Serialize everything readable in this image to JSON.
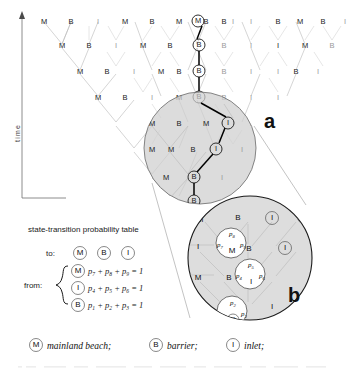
{
  "figure": {
    "axis": {
      "label": "time",
      "direction": "upward-arrow"
    },
    "panels": [
      {
        "id": "a",
        "label": "a"
      },
      {
        "id": "b",
        "label": "b"
      }
    ],
    "states": [
      {
        "code": "M",
        "name": "mainland beach"
      },
      {
        "code": "B",
        "name": "barrier"
      },
      {
        "code": "I",
        "name": "inlet"
      }
    ],
    "lattice": {
      "rows": [
        {
          "level": 0,
          "labels": [
            "M",
            "B",
            "I",
            "M",
            "B",
            "M",
            "B",
            "I",
            "M",
            "B",
            "I",
            "B",
            "M",
            "B",
            "I"
          ]
        },
        {
          "level": 1,
          "labels": [
            "M",
            "B",
            "I",
            "M",
            "B",
            "I",
            "B",
            "M",
            "B",
            "I",
            "I",
            "M",
            "B",
            "I"
          ]
        },
        {
          "level": 2,
          "labels": [
            "M",
            "B",
            "I",
            "M",
            "B",
            "I",
            "M",
            "B",
            "I",
            "I",
            "B",
            "I"
          ]
        },
        {
          "level": 3,
          "labels": [
            "M",
            "B",
            "I",
            "M",
            "B",
            "I",
            "M",
            "M",
            "B",
            "I",
            "I"
          ]
        },
        {
          "level": 4,
          "labels": [
            "M",
            "B",
            "I",
            "M",
            "B",
            "I",
            "I"
          ]
        },
        {
          "level": 5,
          "labels": [
            "M",
            "M",
            "B",
            "I"
          ]
        },
        {
          "level": 6,
          "labels": [
            "M",
            "B"
          ]
        },
        {
          "level": 7,
          "labels": [
            "B"
          ]
        }
      ]
    },
    "highlighted_path": {
      "description": "single realization traced through the lattice",
      "sequence": [
        "M",
        "B",
        "B",
        "B",
        "I",
        "I",
        "B",
        "B"
      ]
    },
    "probability_table": {
      "title": "state-transition probability table",
      "to_label": "to:",
      "from_label": "from:",
      "to_headers": [
        "M",
        "B",
        "I"
      ],
      "rows": [
        {
          "from": "M",
          "terms": [
            "p",
            "p",
            "p"
          ],
          "subs": [
            "7",
            "8",
            "9"
          ],
          "sum": "1"
        },
        {
          "from": "I",
          "terms": [
            "p",
            "p",
            "p"
          ],
          "subs": [
            "4",
            "5",
            "6"
          ],
          "sum": "1"
        },
        {
          "from": "B",
          "terms": [
            "p",
            "p",
            "p"
          ],
          "subs": [
            "1",
            "2",
            "3"
          ],
          "sum": "1"
        }
      ],
      "plus": "+",
      "equals": "="
    },
    "panel_b_probabilities": [
      {
        "state": "M",
        "labels": [
          "p",
          "p",
          "p"
        ],
        "subs": [
          "7",
          "8",
          "9"
        ]
      },
      {
        "state": "I",
        "labels": [
          "p",
          "p",
          "p"
        ],
        "subs": [
          "4",
          "5",
          "6"
        ]
      },
      {
        "state": "B",
        "labels": [
          "p",
          "p",
          "p"
        ],
        "subs": [
          "1",
          "2",
          "3"
        ]
      }
    ],
    "legend": {
      "items": [
        {
          "symbol": "M",
          "text": "mainland beach;"
        },
        {
          "symbol": "B",
          "text": "barrier;"
        },
        {
          "symbol": "I",
          "text": "inlet;"
        }
      ]
    },
    "colors": {
      "lens_fill": "#cfcfcf",
      "edge": "#b9b9b9",
      "path": "#000000",
      "text": "#1a1a1a",
      "background": "#ffffff"
    }
  }
}
